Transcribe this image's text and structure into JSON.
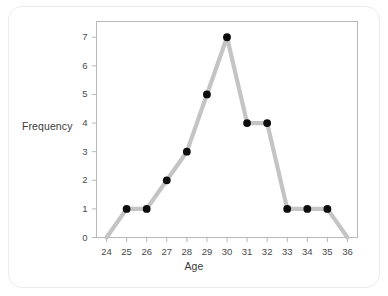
{
  "chart_data": {
    "type": "line",
    "title": "",
    "xlabel": "Age",
    "ylabel": "Frequency",
    "x": [
      24,
      25,
      26,
      27,
      28,
      29,
      30,
      31,
      32,
      33,
      34,
      35,
      36
    ],
    "values": [
      0,
      1,
      1,
      2,
      3,
      5,
      7,
      4,
      4,
      1,
      1,
      1,
      0
    ],
    "categories": [
      "24",
      "25",
      "26",
      "27",
      "28",
      "29",
      "30",
      "31",
      "32",
      "33",
      "34",
      "35",
      "36"
    ],
    "xtick_labels": [
      "24",
      "25",
      "26",
      "27",
      "28",
      "29",
      "30",
      "31",
      "32",
      "33",
      "34",
      "35",
      "36"
    ],
    "ytick_labels": [
      "0",
      "1",
      "2",
      "3",
      "4",
      "5",
      "6",
      "7"
    ],
    "ytick_values": [
      0,
      1,
      2,
      3,
      4,
      5,
      6,
      7
    ],
    "xlim": [
      23.5,
      36.5
    ],
    "ylim": [
      0,
      7.55
    ],
    "grid": false,
    "legend": false,
    "marker_x": [
      25,
      26,
      27,
      28,
      29,
      30,
      31,
      32,
      33,
      34,
      35
    ],
    "marker_values": [
      1,
      1,
      2,
      3,
      5,
      7,
      4,
      4,
      1,
      1,
      1
    ],
    "colors": {
      "line": "#c4c4c4",
      "marker": "#0d0d0d",
      "axis": "#b8b8b8",
      "tick_text": "#4a4a4a",
      "axis_title": "#3b3b3b",
      "plot_background": "#ffffff",
      "card_background": "#ffffff",
      "card_border": "#ececec"
    }
  }
}
